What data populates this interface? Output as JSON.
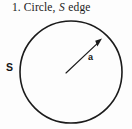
{
  "figure": {
    "caption": {
      "number": "1.",
      "text_before": "Circle,",
      "symbol": "S",
      "text_after": "edge",
      "full": "1. Circle, S edge"
    },
    "labels": {
      "region_label": "S",
      "radius_label": "a"
    },
    "colors": {
      "background": "#fdfdfd",
      "stroke": "#1b1b1b",
      "text": "#151515"
    },
    "geometry": {
      "circle": {
        "cx": 71,
        "cy": 72,
        "r": 51,
        "stroke_width": 1.6
      },
      "radius_arrow": {
        "x1": 66,
        "y1": 73,
        "x2": 101,
        "y2": 40
      },
      "arrowhead": {
        "x": 101,
        "y": 40,
        "size": 7
      }
    }
  }
}
